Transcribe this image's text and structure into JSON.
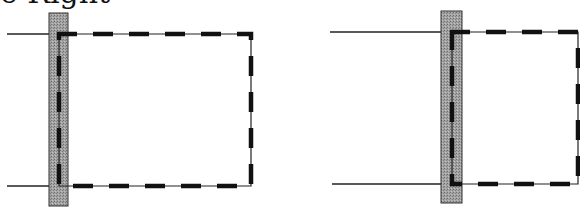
{
  "header": {
    "clipped_title": "e Right"
  },
  "colors": {
    "bar_fill": "#9a9a9a",
    "bar_stroke": "#333333",
    "line": "#222222",
    "dash": "#111111"
  },
  "figures": [
    {
      "name": "left-figure",
      "bar": {
        "x": 49,
        "y": 13,
        "w": 19,
        "h": 193
      },
      "lead_top": {
        "x1": 7,
        "x2": 49,
        "y": 34
      },
      "lead_bottom": {
        "x1": 7,
        "x2": 49,
        "y": 186
      },
      "rect": {
        "x": 59,
        "y": 34,
        "x2": 251,
        "y2": 186
      }
    },
    {
      "name": "right-figure",
      "bar": {
        "x": 441,
        "y": 11,
        "w": 21,
        "h": 192
      },
      "lead_top": {
        "x1": 330,
        "x2": 441,
        "y": 32
      },
      "lead_bottom": {
        "x1": 332,
        "x2": 441,
        "y": 184
      },
      "rect": {
        "x": 452,
        "y": 32,
        "x2": 578,
        "y2": 184
      }
    }
  ]
}
